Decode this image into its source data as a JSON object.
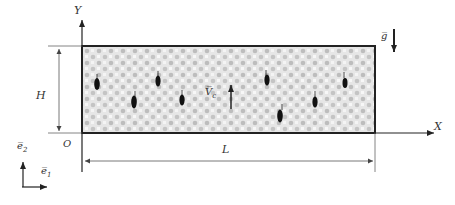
{
  "axes": {
    "x_label": "X",
    "y_label": "Y",
    "origin_label": "O"
  },
  "dimensions": {
    "height_label": "H",
    "length_label": "L"
  },
  "gravity": {
    "label": "g̅"
  },
  "velocity": {
    "label": "V̅",
    "subscript": "c"
  },
  "basis": {
    "e1_label": "e̅",
    "e1_sub": "1",
    "e2_label": "e̅",
    "e2_sub": "2"
  },
  "domain": {
    "fill_color": "#d9d9d9",
    "border_color": "#222222",
    "particles": [
      {
        "x": 97,
        "y": 83,
        "h": 15
      },
      {
        "x": 134,
        "y": 101,
        "h": 16
      },
      {
        "x": 158,
        "y": 80,
        "h": 14
      },
      {
        "x": 182,
        "y": 99,
        "h": 14
      },
      {
        "x": 268,
        "y": 78,
        "h": 14
      },
      {
        "x": 281,
        "y": 114,
        "h": 16
      },
      {
        "x": 315,
        "y": 101,
        "h": 14
      },
      {
        "x": 345,
        "y": 82,
        "h": 13
      }
    ]
  }
}
